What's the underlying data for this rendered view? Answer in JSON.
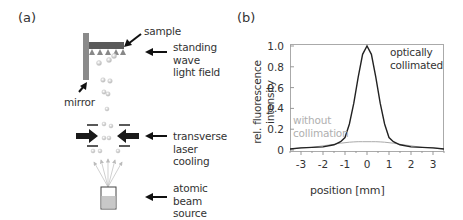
{
  "panel_a": {
    "label": "(a)",
    "annotations": {
      "sample": "sample",
      "standing_wave": [
        "standing",
        "wave",
        "light field"
      ],
      "mirror": "mirror",
      "transverse_cooling": [
        "transverse",
        "laser",
        "cooling"
      ],
      "atomic_beam_source": [
        "atomic",
        "beam",
        "source"
      ]
    },
    "colors": {
      "mirror": "#8a8a8a",
      "sample": "#5a5a5a",
      "arrow": "#111111",
      "source_fill": "#c8c8c8"
    }
  },
  "panel_b": {
    "label": "(b)",
    "ylabel_line1": "rel. fluorescence",
    "ylabel_line2": "intensity",
    "xlabel": "position [mm]",
    "curve_labels": {
      "collimated": [
        "optically",
        "collimated"
      ],
      "uncollimated": [
        "without",
        "collimation"
      ]
    },
    "yticks": [
      "0",
      "0.2",
      "0.4",
      "0.6",
      "0.8",
      "1.0"
    ],
    "xticks": [
      "-3",
      "-2",
      "-1",
      "0",
      "1",
      "2",
      "3"
    ]
  },
  "chart_data": {
    "type": "line",
    "title": "",
    "xlabel": "position [mm]",
    "ylabel": "rel. fluorescence intensity",
    "xlim": [
      -3.5,
      3.5
    ],
    "ylim": [
      0,
      1.05
    ],
    "grid": false,
    "legend": "inline annotations",
    "x": [
      -3.5,
      -3.0,
      -2.5,
      -2.0,
      -1.5,
      -1.2,
      -1.0,
      -0.8,
      -0.6,
      -0.4,
      -0.2,
      0.0,
      0.2,
      0.4,
      0.6,
      0.8,
      1.0,
      1.2,
      1.5,
      2.0,
      2.5,
      3.0,
      3.5
    ],
    "series": [
      {
        "name": "optically collimated",
        "color": "#222222",
        "values": [
          0.01,
          0.02,
          0.025,
          0.03,
          0.05,
          0.08,
          0.12,
          0.25,
          0.45,
          0.7,
          0.92,
          1.0,
          0.92,
          0.7,
          0.45,
          0.25,
          0.12,
          0.08,
          0.05,
          0.03,
          0.025,
          0.02,
          0.01
        ]
      },
      {
        "name": "without collimation",
        "color": "#aaaaaa",
        "values": [
          0.01,
          0.02,
          0.025,
          0.04,
          0.055,
          0.065,
          0.07,
          0.075,
          0.078,
          0.08,
          0.08,
          0.08,
          0.08,
          0.08,
          0.078,
          0.075,
          0.07,
          0.065,
          0.055,
          0.04,
          0.025,
          0.02,
          0.01
        ]
      }
    ]
  }
}
